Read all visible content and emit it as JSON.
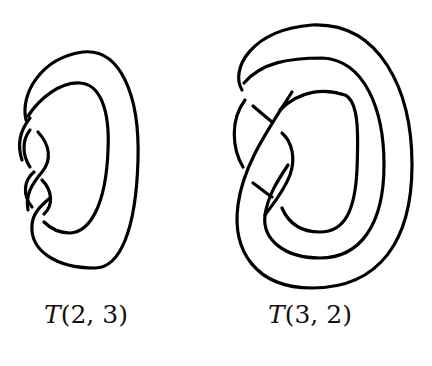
{
  "figure": {
    "knots": [
      {
        "id": "torus-knot-left",
        "label_prefix": "T",
        "label_args": "(2, 3)",
        "label": "T(2, 3)",
        "crossings": 3
      },
      {
        "id": "torus-knot-right",
        "label_prefix": "T",
        "label_args": "(3, 2)",
        "label": "T(3, 2)",
        "crossings": 4
      }
    ],
    "colors": {
      "stroke": "#000000",
      "background": "#ffffff"
    }
  }
}
